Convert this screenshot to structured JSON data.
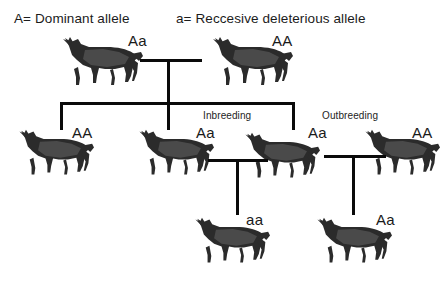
{
  "diagram": {
    "title_type": "pedigree-chart",
    "background_color": "#ffffff",
    "line_color": "#0a0a0a",
    "text_color": "#1a1a1a"
  },
  "legend": {
    "dominant": "A= Dominant allele",
    "recessive": "a= Reccesive deleterious allele"
  },
  "captions": {
    "inbreeding": "Inbreeding",
    "outbreeding": "Outbreeding"
  },
  "generations": [
    {
      "name": "generation-1",
      "animals": [
        {
          "id": "p1",
          "genotype": "Aa"
        },
        {
          "id": "p2",
          "genotype": "AA"
        }
      ]
    },
    {
      "name": "generation-2",
      "animals": [
        {
          "id": "f1a",
          "genotype": "AA"
        },
        {
          "id": "f1b",
          "genotype": "Aa"
        },
        {
          "id": "f1c",
          "genotype": "Aa"
        },
        {
          "id": "f1d",
          "genotype": "AA"
        }
      ]
    },
    {
      "name": "generation-3",
      "animals": [
        {
          "id": "f2a",
          "genotype": "aa"
        },
        {
          "id": "f2b",
          "genotype": "Aa"
        }
      ]
    }
  ],
  "icons": {
    "horse": "horse-icon"
  }
}
